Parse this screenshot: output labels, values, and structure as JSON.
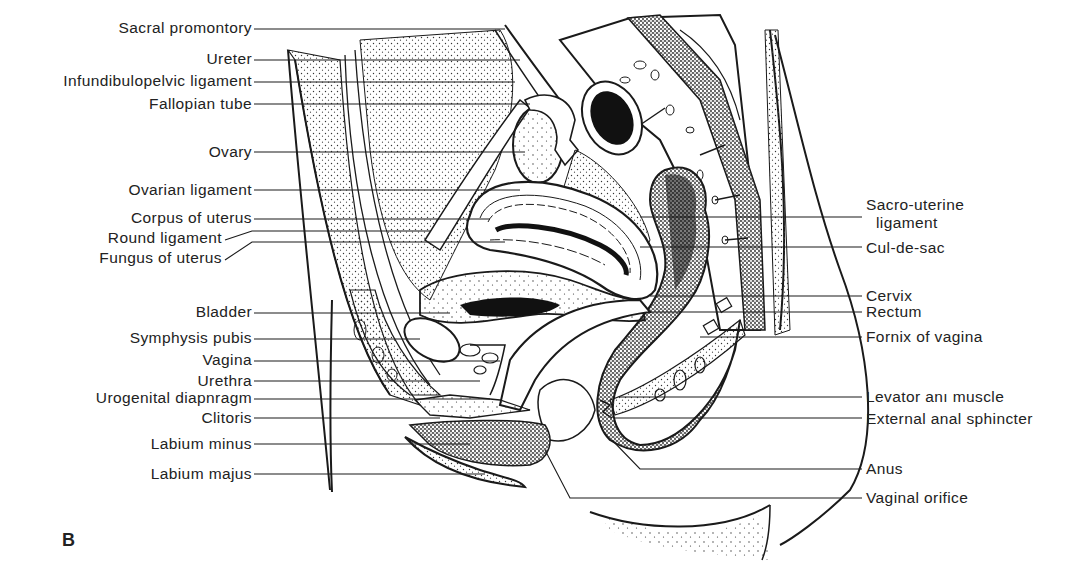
{
  "figure": {
    "panel_letter": "B",
    "colors": {
      "ink": "#1a1a1a",
      "background": "#ffffff",
      "stipple": "#333333"
    }
  },
  "labels": {
    "left": [
      {
        "text": "Sacral promontory",
        "x_end": 252,
        "y": 28,
        "line_to": 505
      },
      {
        "text": "Ureter",
        "x_end": 252,
        "y": 59,
        "line_to": 520
      },
      {
        "text": "Infundibulopelvic ligament",
        "x_end": 252,
        "y": 81,
        "line_to": 515
      },
      {
        "text": "Fallopian tube",
        "x_end": 252,
        "y": 104,
        "line_to": 530
      },
      {
        "text": "Ovary",
        "x_end": 252,
        "y": 152,
        "line_to": 525
      },
      {
        "text": "Ovarian ligament",
        "x_end": 252,
        "y": 190,
        "line_to": 520
      },
      {
        "text": "Corpus of uterus",
        "x_end": 252,
        "y": 218,
        "line_to": 490
      },
      {
        "text": "Round ligament",
        "x_end": 222,
        "y": 238,
        "line_to": 430
      },
      {
        "text": "Fungus of uterus",
        "x_end": 222,
        "y": 258,
        "line_to": 505
      },
      {
        "text": "Bladder",
        "x_end": 252,
        "y": 312,
        "line_to": 450
      },
      {
        "text": "Symphysis pubis",
        "x_end": 252,
        "y": 338,
        "line_to": 420
      },
      {
        "text": "Vagina",
        "x_end": 252,
        "y": 360,
        "line_to": 500
      },
      {
        "text": "Urethra",
        "x_end": 252,
        "y": 381,
        "line_to": 480
      },
      {
        "text": "Urogenital diapnragm",
        "x_end": 252,
        "y": 398,
        "line_to": 490
      },
      {
        "text": "Clitoris",
        "x_end": 252,
        "y": 418,
        "line_to": 440
      },
      {
        "text": "Labium minus",
        "x_end": 252,
        "y": 444,
        "line_to": 470
      },
      {
        "text": "Labium majus",
        "x_end": 252,
        "y": 474,
        "line_to": 485
      }
    ],
    "right": [
      {
        "text": "Sacro-uterine",
        "text2": "ligament",
        "x_start": 866,
        "y": 205,
        "line_from": 640,
        "line_y": 217
      },
      {
        "text": "Cul-de-sac",
        "x_start": 866,
        "y": 248,
        "line_from": 640,
        "line_y": 247
      },
      {
        "text": "Cervix",
        "x_start": 866,
        "y": 296,
        "line_from": 650,
        "line_y": 296
      },
      {
        "text": "Rectum",
        "x_start": 866,
        "y": 312,
        "line_from": 650,
        "line_y": 312
      },
      {
        "text": "Fornix of vagina",
        "x_start": 866,
        "y": 338,
        "line_from": 700,
        "line_y": 337
      },
      {
        "text": "Levator anı muscle",
        "x_start": 866,
        "y": 397,
        "line_from": 620,
        "line_y": 397
      },
      {
        "text": "External anal sphincter",
        "x_start": 866,
        "y": 419,
        "line_from": 615,
        "line_y": 418
      },
      {
        "text": "Anus",
        "x_start": 866,
        "y": 469,
        "line_from": 640,
        "line_y": 469
      },
      {
        "text": "Vaginal orifice",
        "x_start": 866,
        "y": 498,
        "line_from": 570,
        "line_y": 498
      }
    ]
  }
}
